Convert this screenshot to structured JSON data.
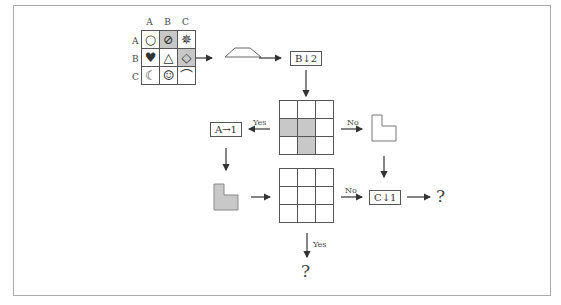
{
  "symbol_grid": {
    "col_headers": [
      "A",
      "B",
      "C"
    ],
    "row_headers": [
      "A",
      "B",
      "C"
    ],
    "cells": [
      [
        "○",
        "⊘",
        "✵"
      ],
      [
        "♥",
        "△",
        "◇"
      ],
      [
        "☾",
        "☺",
        "⌒"
      ]
    ],
    "shaded": [
      [
        0,
        1
      ],
      [
        1,
        2
      ]
    ]
  },
  "steps": {
    "op1": "B↓2",
    "op2": "A→1",
    "op3": "C↓1",
    "yes": "Yes",
    "no": "No",
    "question": "?"
  },
  "grid_top": {
    "shaded": [
      [
        1,
        0
      ],
      [
        1,
        1
      ],
      [
        2,
        1
      ]
    ]
  },
  "grid_bottom": {
    "shaded": []
  }
}
